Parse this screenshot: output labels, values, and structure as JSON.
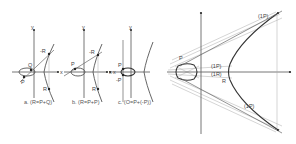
{
  "figure": {
    "panels": [
      {
        "id": "a",
        "caption": "a. (R=P+Q)",
        "axis_x": "x",
        "axis_y": "y",
        "points": [
          "P",
          "Q",
          "-R",
          "R"
        ]
      },
      {
        "id": "b",
        "caption": "b. (R=P+P)",
        "axis_x": "x",
        "axis_y": "y",
        "points": [
          "P",
          "-R",
          "R"
        ]
      },
      {
        "id": "c",
        "caption": "c. (O=P+(-P))",
        "axis_x": "x",
        "axis_y": "y",
        "points": [
          "P",
          "-P"
        ]
      }
    ],
    "large": {
      "labels": {
        "p": "P",
        "top_1p": "(1P)",
        "mid_1p": "(1P)",
        "mid_1r": "(1R)",
        "r": "R",
        "bottom_1p": "(1P)"
      }
    }
  },
  "colors": {
    "stroke": "#555555",
    "point": "#222222",
    "background": "#ffffff"
  }
}
